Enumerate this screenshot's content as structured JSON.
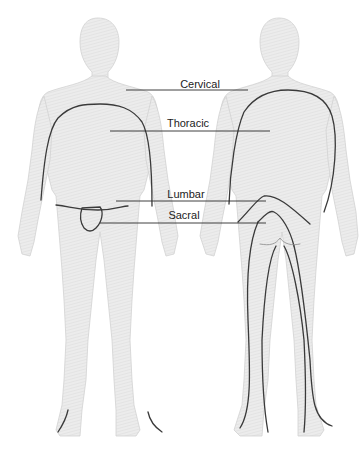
{
  "diagram": {
    "type": "anatomical-dermatome-regions",
    "views": [
      "anterior",
      "posterior"
    ],
    "colors": {
      "body_fill": "#e9e9e9",
      "body_outline": "#cfcfcf",
      "region_line": "#3a3a3a",
      "leader_line": "#2a2a2a",
      "label_text": "#1c1c1c"
    },
    "labels": [
      {
        "id": "cervical",
        "text": "Cervical",
        "x": 200,
        "y": 80
      },
      {
        "id": "thoracic",
        "text": "Thoracic",
        "x": 188,
        "y": 119
      },
      {
        "id": "lumbar",
        "text": "Lumbar",
        "x": 186,
        "y": 190
      },
      {
        "id": "sacral",
        "text": "Sacral",
        "x": 184,
        "y": 209
      }
    ]
  }
}
